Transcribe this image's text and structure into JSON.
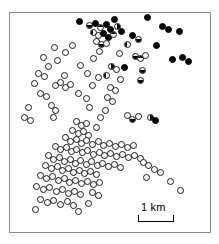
{
  "figure": {
    "kind": "distribution-map",
    "frame": {
      "x": 9,
      "y": 12,
      "width": 202,
      "height": 221,
      "border_color": "#8a8a8a"
    }
  },
  "scale": {
    "label": "1 km",
    "bar_length_px": 36
  },
  "chart_data": {
    "type": "scatter",
    "title": "",
    "subtitle": "",
    "xlabel": "",
    "ylabel": "",
    "grid": false,
    "legend_position": "none",
    "axes_visible": false,
    "xlim": [
      0,
      202
    ],
    "ylim": [
      0,
      221
    ],
    "units": "pixels within map frame",
    "scale_bar": {
      "label": "1 km",
      "length_px": 36
    },
    "marker_categories": [
      {
        "key": "open",
        "style": "open circle",
        "fill": "#ffffff",
        "stroke": "#1a1a1a"
      },
      {
        "key": "half",
        "style": "half-filled circle",
        "fill": "#000000",
        "stroke": "#1a1a1a"
      },
      {
        "key": "solid",
        "style": "solid black circle",
        "fill": "#000000",
        "stroke": "#000000"
      }
    ],
    "counts": {
      "open": 132,
      "half": 21,
      "solid": 26,
      "total": 179
    },
    "points": [
      {
        "x": 69,
        "y": 8,
        "t": "solid"
      },
      {
        "x": 104,
        "y": 6,
        "t": "solid"
      },
      {
        "x": 137,
        "y": 4,
        "t": "solid"
      },
      {
        "x": 79,
        "y": 12,
        "t": "half",
        "o": "b"
      },
      {
        "x": 85,
        "y": 10,
        "t": "solid"
      },
      {
        "x": 90,
        "y": 14,
        "t": "half"
      },
      {
        "x": 96,
        "y": 11,
        "t": "solid"
      },
      {
        "x": 100,
        "y": 16,
        "t": "solid"
      },
      {
        "x": 107,
        "y": 13,
        "t": "half",
        "o": "r"
      },
      {
        "x": 111,
        "y": 18,
        "t": "solid"
      },
      {
        "x": 83,
        "y": 19,
        "t": "half",
        "o": "l"
      },
      {
        "x": 88,
        "y": 22,
        "t": "open"
      },
      {
        "x": 93,
        "y": 20,
        "t": "solid"
      },
      {
        "x": 98,
        "y": 24,
        "t": "solid"
      },
      {
        "x": 103,
        "y": 21,
        "t": "half"
      },
      {
        "x": 152,
        "y": 13,
        "t": "solid"
      },
      {
        "x": 158,
        "y": 16,
        "t": "solid"
      },
      {
        "x": 169,
        "y": 18,
        "t": "solid"
      },
      {
        "x": 122,
        "y": 22,
        "t": "solid"
      },
      {
        "x": 128,
        "y": 26,
        "t": "half",
        "o": "b"
      },
      {
        "x": 86,
        "y": 28,
        "t": "open"
      },
      {
        "x": 91,
        "y": 31,
        "t": "half",
        "o": "b"
      },
      {
        "x": 96,
        "y": 30,
        "t": "open"
      },
      {
        "x": 117,
        "y": 31,
        "t": "half",
        "o": "l"
      },
      {
        "x": 146,
        "y": 32,
        "t": "solid"
      },
      {
        "x": 44,
        "y": 34,
        "t": "open"
      },
      {
        "x": 62,
        "y": 32,
        "t": "open"
      },
      {
        "x": 55,
        "y": 39,
        "t": "open"
      },
      {
        "x": 89,
        "y": 38,
        "t": "open"
      },
      {
        "x": 109,
        "y": 40,
        "t": "open"
      },
      {
        "x": 33,
        "y": 44,
        "t": "open"
      },
      {
        "x": 47,
        "y": 47,
        "t": "open"
      },
      {
        "x": 83,
        "y": 45,
        "t": "open"
      },
      {
        "x": 125,
        "y": 43,
        "t": "half",
        "o": "b"
      },
      {
        "x": 130,
        "y": 45,
        "t": "half"
      },
      {
        "x": 135,
        "y": 42,
        "t": "open"
      },
      {
        "x": 162,
        "y": 46,
        "t": "solid"
      },
      {
        "x": 172,
        "y": 44,
        "t": "solid"
      },
      {
        "x": 178,
        "y": 48,
        "t": "solid"
      },
      {
        "x": 38,
        "y": 53,
        "t": "open"
      },
      {
        "x": 70,
        "y": 52,
        "t": "open"
      },
      {
        "x": 101,
        "y": 53,
        "t": "half",
        "o": "r"
      },
      {
        "x": 106,
        "y": 56,
        "t": "open"
      },
      {
        "x": 114,
        "y": 54,
        "t": "solid"
      },
      {
        "x": 132,
        "y": 57,
        "t": "half",
        "o": "b"
      },
      {
        "x": 28,
        "y": 60,
        "t": "open"
      },
      {
        "x": 34,
        "y": 63,
        "t": "open"
      },
      {
        "x": 54,
        "y": 62,
        "t": "open"
      },
      {
        "x": 77,
        "y": 60,
        "t": "open"
      },
      {
        "x": 88,
        "y": 64,
        "t": "open"
      },
      {
        "x": 96,
        "y": 62,
        "t": "half",
        "o": "l"
      },
      {
        "x": 110,
        "y": 66,
        "t": "open"
      },
      {
        "x": 130,
        "y": 67,
        "t": "half",
        "o": "b"
      },
      {
        "x": 24,
        "y": 70,
        "t": "open"
      },
      {
        "x": 45,
        "y": 72,
        "t": "open"
      },
      {
        "x": 50,
        "y": 69,
        "t": "open"
      },
      {
        "x": 55,
        "y": 74,
        "t": "open"
      },
      {
        "x": 60,
        "y": 71,
        "t": "open"
      },
      {
        "x": 82,
        "y": 72,
        "t": "open"
      },
      {
        "x": 100,
        "y": 74,
        "t": "open"
      },
      {
        "x": 105,
        "y": 77,
        "t": "open"
      },
      {
        "x": 30,
        "y": 80,
        "t": "open"
      },
      {
        "x": 36,
        "y": 83,
        "t": "open"
      },
      {
        "x": 68,
        "y": 80,
        "t": "open"
      },
      {
        "x": 76,
        "y": 85,
        "t": "open"
      },
      {
        "x": 97,
        "y": 84,
        "t": "open"
      },
      {
        "x": 102,
        "y": 88,
        "t": "open"
      },
      {
        "x": 18,
        "y": 94,
        "t": "open"
      },
      {
        "x": 41,
        "y": 92,
        "t": "open"
      },
      {
        "x": 45,
        "y": 97,
        "t": "open"
      },
      {
        "x": 79,
        "y": 94,
        "t": "open"
      },
      {
        "x": 95,
        "y": 97,
        "t": "open"
      },
      {
        "x": 14,
        "y": 104,
        "t": "open"
      },
      {
        "x": 20,
        "y": 107,
        "t": "open"
      },
      {
        "x": 43,
        "y": 104,
        "t": "open"
      },
      {
        "x": 90,
        "y": 104,
        "t": "open"
      },
      {
        "x": 117,
        "y": 102,
        "t": "open"
      },
      {
        "x": 122,
        "y": 106,
        "t": "half",
        "o": "b"
      },
      {
        "x": 128,
        "y": 103,
        "t": "open"
      },
      {
        "x": 140,
        "y": 104,
        "t": "half",
        "o": "r"
      },
      {
        "x": 145,
        "y": 107,
        "t": "solid"
      },
      {
        "x": 66,
        "y": 108,
        "t": "open"
      },
      {
        "x": 71,
        "y": 112,
        "t": "open"
      },
      {
        "x": 76,
        "y": 110,
        "t": "open"
      },
      {
        "x": 86,
        "y": 114,
        "t": "open"
      },
      {
        "x": 62,
        "y": 117,
        "t": "open"
      },
      {
        "x": 68,
        "y": 120,
        "t": "open"
      },
      {
        "x": 73,
        "y": 118,
        "t": "open"
      },
      {
        "x": 78,
        "y": 122,
        "t": "open"
      },
      {
        "x": 55,
        "y": 124,
        "t": "open"
      },
      {
        "x": 60,
        "y": 128,
        "t": "open"
      },
      {
        "x": 66,
        "y": 126,
        "t": "open"
      },
      {
        "x": 71,
        "y": 130,
        "t": "open"
      },
      {
        "x": 76,
        "y": 127,
        "t": "open"
      },
      {
        "x": 82,
        "y": 131,
        "t": "open"
      },
      {
        "x": 88,
        "y": 128,
        "t": "open"
      },
      {
        "x": 93,
        "y": 132,
        "t": "open"
      },
      {
        "x": 99,
        "y": 130,
        "t": "open"
      },
      {
        "x": 105,
        "y": 133,
        "t": "open"
      },
      {
        "x": 111,
        "y": 131,
        "t": "open"
      },
      {
        "x": 117,
        "y": 134,
        "t": "open"
      },
      {
        "x": 123,
        "y": 132,
        "t": "open"
      },
      {
        "x": 45,
        "y": 133,
        "t": "open"
      },
      {
        "x": 50,
        "y": 136,
        "t": "open"
      },
      {
        "x": 56,
        "y": 134,
        "t": "open"
      },
      {
        "x": 61,
        "y": 138,
        "t": "open"
      },
      {
        "x": 66,
        "y": 136,
        "t": "open"
      },
      {
        "x": 72,
        "y": 139,
        "t": "open"
      },
      {
        "x": 77,
        "y": 137,
        "t": "open"
      },
      {
        "x": 83,
        "y": 141,
        "t": "open"
      },
      {
        "x": 89,
        "y": 139,
        "t": "open"
      },
      {
        "x": 94,
        "y": 142,
        "t": "open"
      },
      {
        "x": 100,
        "y": 140,
        "t": "open"
      },
      {
        "x": 106,
        "y": 143,
        "t": "open"
      },
      {
        "x": 112,
        "y": 141,
        "t": "open"
      },
      {
        "x": 118,
        "y": 144,
        "t": "open"
      },
      {
        "x": 124,
        "y": 142,
        "t": "open"
      },
      {
        "x": 130,
        "y": 145,
        "t": "open"
      },
      {
        "x": 38,
        "y": 142,
        "t": "open"
      },
      {
        "x": 43,
        "y": 146,
        "t": "open"
      },
      {
        "x": 49,
        "y": 144,
        "t": "open"
      },
      {
        "x": 54,
        "y": 148,
        "t": "open"
      },
      {
        "x": 60,
        "y": 146,
        "t": "open"
      },
      {
        "x": 65,
        "y": 150,
        "t": "open"
      },
      {
        "x": 70,
        "y": 147,
        "t": "open"
      },
      {
        "x": 76,
        "y": 151,
        "t": "open"
      },
      {
        "x": 81,
        "y": 148,
        "t": "open"
      },
      {
        "x": 87,
        "y": 152,
        "t": "open"
      },
      {
        "x": 92,
        "y": 150,
        "t": "open"
      },
      {
        "x": 98,
        "y": 153,
        "t": "open"
      },
      {
        "x": 104,
        "y": 151,
        "t": "open"
      },
      {
        "x": 110,
        "y": 154,
        "t": "open"
      },
      {
        "x": 133,
        "y": 149,
        "t": "open"
      },
      {
        "x": 138,
        "y": 152,
        "t": "open"
      },
      {
        "x": 35,
        "y": 152,
        "t": "open"
      },
      {
        "x": 41,
        "y": 155,
        "t": "open"
      },
      {
        "x": 47,
        "y": 153,
        "t": "open"
      },
      {
        "x": 52,
        "y": 157,
        "t": "open"
      },
      {
        "x": 58,
        "y": 155,
        "t": "open"
      },
      {
        "x": 63,
        "y": 159,
        "t": "open"
      },
      {
        "x": 69,
        "y": 157,
        "t": "open"
      },
      {
        "x": 74,
        "y": 160,
        "t": "open"
      },
      {
        "x": 80,
        "y": 158,
        "t": "open"
      },
      {
        "x": 86,
        "y": 161,
        "t": "open"
      },
      {
        "x": 144,
        "y": 156,
        "t": "open"
      },
      {
        "x": 150,
        "y": 159,
        "t": "open"
      },
      {
        "x": 30,
        "y": 162,
        "t": "open"
      },
      {
        "x": 36,
        "y": 165,
        "t": "open"
      },
      {
        "x": 42,
        "y": 163,
        "t": "open"
      },
      {
        "x": 48,
        "y": 167,
        "t": "open"
      },
      {
        "x": 54,
        "y": 165,
        "t": "open"
      },
      {
        "x": 59,
        "y": 169,
        "t": "open"
      },
      {
        "x": 65,
        "y": 167,
        "t": "open"
      },
      {
        "x": 71,
        "y": 170,
        "t": "open"
      },
      {
        "x": 77,
        "y": 168,
        "t": "open"
      },
      {
        "x": 83,
        "y": 171,
        "t": "open"
      },
      {
        "x": 89,
        "y": 169,
        "t": "open"
      },
      {
        "x": 136,
        "y": 164,
        "t": "open"
      },
      {
        "x": 160,
        "y": 168,
        "t": "open"
      },
      {
        "x": 26,
        "y": 173,
        "t": "open"
      },
      {
        "x": 33,
        "y": 176,
        "t": "open"
      },
      {
        "x": 39,
        "y": 174,
        "t": "open"
      },
      {
        "x": 46,
        "y": 178,
        "t": "open"
      },
      {
        "x": 52,
        "y": 176,
        "t": "open"
      },
      {
        "x": 58,
        "y": 180,
        "t": "open"
      },
      {
        "x": 64,
        "y": 178,
        "t": "open"
      },
      {
        "x": 70,
        "y": 181,
        "t": "open"
      },
      {
        "x": 82,
        "y": 179,
        "t": "open"
      },
      {
        "x": 88,
        "y": 182,
        "t": "open"
      },
      {
        "x": 170,
        "y": 177,
        "t": "open"
      },
      {
        "x": 30,
        "y": 186,
        "t": "open"
      },
      {
        "x": 37,
        "y": 189,
        "t": "open"
      },
      {
        "x": 43,
        "y": 187,
        "t": "open"
      },
      {
        "x": 50,
        "y": 191,
        "t": "open"
      },
      {
        "x": 57,
        "y": 188,
        "t": "open"
      },
      {
        "x": 63,
        "y": 192,
        "t": "open"
      },
      {
        "x": 78,
        "y": 190,
        "t": "open"
      },
      {
        "x": 25,
        "y": 196,
        "t": "open"
      },
      {
        "x": 68,
        "y": 198,
        "t": "open"
      }
    ]
  }
}
